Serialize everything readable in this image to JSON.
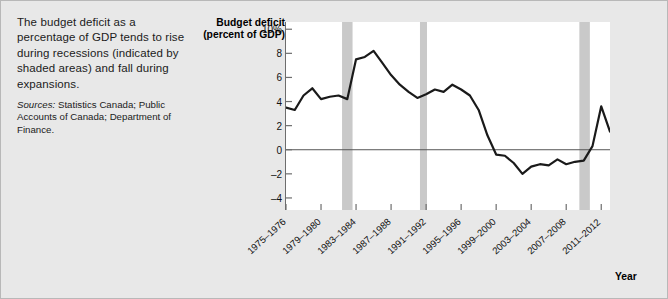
{
  "caption": {
    "main": "The budget deficit as a percentage of GDP tends to rise during recessions (indicated by shaded areas) and fall during expansions.",
    "sources_label": "Sources:",
    "sources_text": " Statistics Canada; Public Accounts of Canada; Department of Finance."
  },
  "chart_data": {
    "type": "line",
    "title": "Budget deficit (percent of GDP)",
    "xlabel": "Year",
    "ylabel": "Budget deficit (percent of GDP)",
    "ylim": [
      -5,
      10.6
    ],
    "xlim": [
      1975,
      2012
    ],
    "grid": false,
    "legend": "none",
    "zero_line": true,
    "y_ticks": [
      {
        "value": 10,
        "label": "10%"
      },
      {
        "value": 8,
        "label": "8"
      },
      {
        "value": 6,
        "label": "6"
      },
      {
        "value": 4,
        "label": "4"
      },
      {
        "value": 2,
        "label": "2"
      },
      {
        "value": 0,
        "label": "0"
      },
      {
        "value": -2,
        "label": "–2"
      },
      {
        "value": -4,
        "label": "–4"
      }
    ],
    "x_ticks": [
      {
        "value": 1975,
        "label": "1975–1976"
      },
      {
        "value": 1979,
        "label": "1979–1980"
      },
      {
        "value": 1983,
        "label": "1983–1984"
      },
      {
        "value": 1987,
        "label": "1987–1988"
      },
      {
        "value": 1991,
        "label": "1991–1992"
      },
      {
        "value": 1995,
        "label": "1995–1996"
      },
      {
        "value": 1999,
        "label": "1999–2000"
      },
      {
        "value": 2003,
        "label": "2003–2004"
      },
      {
        "value": 2007,
        "label": "2007–2008"
      },
      {
        "value": 2011,
        "label": "2011–2012"
      }
    ],
    "recession_bands": [
      {
        "start": 1981.4,
        "end": 1982.6,
        "label": "1981–1982 recession"
      },
      {
        "start": 1990.3,
        "end": 1991.1,
        "label": "1990–1991 recession"
      },
      {
        "start": 2008.5,
        "end": 2009.7,
        "label": "2008–2009 recession"
      }
    ],
    "series": [
      {
        "name": "Budget deficit (percent of GDP)",
        "color": "#1a1a1a",
        "x": [
          1975,
          1976,
          1977,
          1978,
          1979,
          1980,
          1981,
          1982,
          1983,
          1984,
          1985,
          1986,
          1987,
          1988,
          1989,
          1990,
          1991,
          1992,
          1993,
          1994,
          1995,
          1996,
          1997,
          1998,
          1999,
          2000,
          2001,
          2002,
          2003,
          2004,
          2005,
          2006,
          2007,
          2008,
          2009,
          2010,
          2011,
          2012
        ],
        "values": [
          3.5,
          3.3,
          4.5,
          5.1,
          4.2,
          4.4,
          4.5,
          4.2,
          7.5,
          7.7,
          8.2,
          7.2,
          6.2,
          5.4,
          4.8,
          4.3,
          4.6,
          5.0,
          4.8,
          5.4,
          5.0,
          4.5,
          3.3,
          1.2,
          -0.4,
          -0.5,
          -1.1,
          -2.0,
          -1.4,
          -1.2,
          -1.3,
          -0.8,
          -1.2,
          -1.0,
          -0.9,
          0.3,
          3.6,
          1.5
        ]
      }
    ]
  }
}
